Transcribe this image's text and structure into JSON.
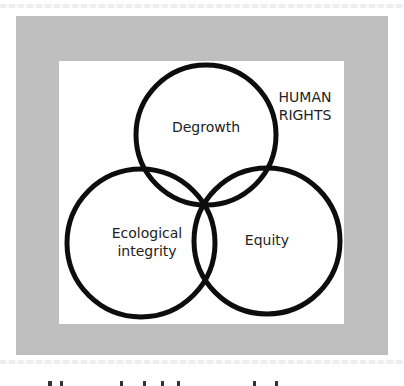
{
  "diagram": {
    "type": "venn",
    "frame_color": "#bfbfbf",
    "inner_color": "#ffffff",
    "stroke_color": "#0d0d0d",
    "outer_label": "HUMAN RIGHTS",
    "outer_label_lines": [
      "HUMAN",
      "RIGHTS"
    ],
    "circles": [
      {
        "id": "degrowth",
        "label": "Degrowth",
        "cx": 206,
        "cy": 135,
        "r": 70
      },
      {
        "id": "ecological",
        "label": "Ecological integrity",
        "lines": [
          "Ecological",
          "integrity"
        ],
        "cx": 141,
        "cy": 243,
        "r": 74
      },
      {
        "id": "equity",
        "label": "Equity",
        "cx": 267,
        "cy": 241,
        "r": 73
      }
    ]
  }
}
